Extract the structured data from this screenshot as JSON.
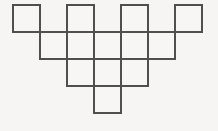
{
  "figure": {
    "background_color": "#f6f5f3",
    "cell_fill_color": "#f7f6f4",
    "stroke_color": "#4f4f4f",
    "stroke_width": 1.6,
    "grid": {
      "origin_x": 13,
      "origin_y": 5,
      "cell_size": 27,
      "columns": 7,
      "rows": 4
    },
    "rows": [
      {
        "index": 0,
        "label": "top-row",
        "columns": [
          0,
          2,
          4,
          6
        ],
        "count": 4
      },
      {
        "index": 1,
        "label": "second-row",
        "columns": [
          1,
          2,
          3,
          4,
          5
        ],
        "count": 5
      },
      {
        "index": 2,
        "label": "third-row",
        "columns": [
          2,
          3,
          4
        ],
        "count": 3
      },
      {
        "index": 3,
        "label": "bottom-row",
        "columns": [
          3
        ],
        "count": 1
      }
    ],
    "total_squares": 13
  },
  "chart_data": {
    "type": "table",
    "xlabel": "",
    "ylabel": "",
    "categories": [
      "top-row",
      "second-row",
      "third-row",
      "bottom-row"
    ],
    "values": [
      4,
      5,
      3,
      1
    ],
    "cells": [
      {
        "row": 0,
        "col": 0
      },
      {
        "row": 0,
        "col": 2
      },
      {
        "row": 0,
        "col": 4
      },
      {
        "row": 0,
        "col": 6
      },
      {
        "row": 1,
        "col": 1
      },
      {
        "row": 1,
        "col": 2
      },
      {
        "row": 1,
        "col": 3
      },
      {
        "row": 1,
        "col": 4
      },
      {
        "row": 1,
        "col": 5
      },
      {
        "row": 2,
        "col": 2
      },
      {
        "row": 2,
        "col": 3
      },
      {
        "row": 2,
        "col": 4
      },
      {
        "row": 3,
        "col": 3
      }
    ],
    "grid": true,
    "legend": "none"
  }
}
